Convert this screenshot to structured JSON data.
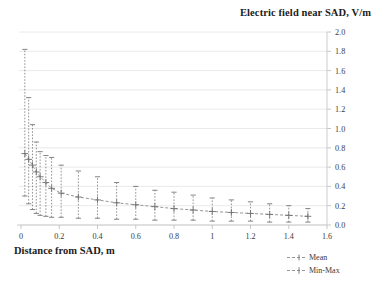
{
  "chart_data": {
    "type": "scatter",
    "title": "Electric field near SAD, V/m",
    "xlabel": "Distance from SAD, m",
    "ylabel": "Electric field near SAD, V/m",
    "xlim": [
      0,
      1.6
    ],
    "ylim": [
      0.0,
      2.0
    ],
    "xticks": [
      "0",
      "0.2",
      "0.4",
      "0.6",
      "0.8",
      "1",
      "1.2",
      "1.4",
      "1.6"
    ],
    "xtick_values": [
      0,
      0.2,
      0.4,
      0.6,
      0.8,
      1.0,
      1.2,
      1.4,
      1.6
    ],
    "yticks": [
      "0.0",
      "0.2",
      "0.4",
      "0.6",
      "0.8",
      "1.0",
      "1.2",
      "1.4",
      "1.6",
      "1.8",
      "2.0"
    ],
    "ytick_values": [
      0.0,
      0.2,
      0.4,
      0.6,
      0.8,
      1.0,
      1.2,
      1.4,
      1.6,
      1.8,
      2.0
    ],
    "y_axis_position": "right",
    "grid": "horizontal",
    "legend_position": "bottom-right",
    "series": [
      {
        "name": "Mean",
        "marker": "cross",
        "line": "dashed"
      },
      {
        "name": "Min-Max",
        "marker": "cross-whisker",
        "line": "dashed"
      }
    ],
    "x": [
      0.02,
      0.04,
      0.06,
      0.08,
      0.1,
      0.13,
      0.16,
      0.21,
      0.3,
      0.4,
      0.5,
      0.6,
      0.7,
      0.8,
      0.9,
      1.0,
      1.1,
      1.2,
      1.3,
      1.4,
      1.5
    ],
    "mean": [
      0.74,
      0.68,
      0.62,
      0.55,
      0.5,
      0.44,
      0.38,
      0.33,
      0.29,
      0.26,
      0.23,
      0.21,
      0.19,
      0.17,
      0.155,
      0.14,
      0.13,
      0.12,
      0.11,
      0.1,
      0.09
    ],
    "min": [
      0.3,
      0.22,
      0.16,
      0.12,
      0.1,
      0.09,
      0.08,
      0.08,
      0.07,
      0.07,
      0.06,
      0.06,
      0.05,
      0.05,
      0.05,
      0.04,
      0.04,
      0.04,
      0.03,
      0.03,
      0.03
    ],
    "max": [
      1.82,
      1.32,
      1.04,
      0.86,
      0.76,
      0.72,
      0.7,
      0.62,
      0.56,
      0.5,
      0.44,
      0.4,
      0.36,
      0.34,
      0.31,
      0.28,
      0.26,
      0.24,
      0.22,
      0.2,
      0.17
    ]
  },
  "legend": {
    "mean_label": "Mean",
    "minmax_label": "Min-Max"
  },
  "colors": {
    "grid": "#e4e4e4",
    "marker": "#6f6f6f",
    "line": "#8a8a8a",
    "text": "#2b2b2b"
  }
}
